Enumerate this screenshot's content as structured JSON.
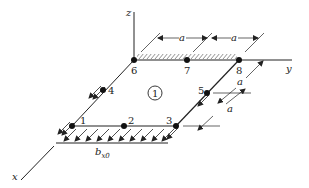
{
  "diagram": {
    "type": "finite element plate, isometric view",
    "axes": {
      "x": "x",
      "y": "y",
      "z": "z"
    },
    "nodes": [
      {
        "id": "1",
        "label": "1"
      },
      {
        "id": "2",
        "label": "2"
      },
      {
        "id": "3",
        "label": "3"
      },
      {
        "id": "4",
        "label": "4"
      },
      {
        "id": "5",
        "label": "5"
      },
      {
        "id": "6",
        "label": "6"
      },
      {
        "id": "7",
        "label": "7"
      },
      {
        "id": "8",
        "label": "8"
      }
    ],
    "element_label": "1",
    "dimension_labels": {
      "top_left": "a",
      "top_right": "a",
      "side_upper": "a",
      "side_lower": "a"
    },
    "load": {
      "symbol": "b",
      "subscript": "x0"
    },
    "colors": {
      "line": "#222222",
      "background": "#ffffff"
    }
  }
}
